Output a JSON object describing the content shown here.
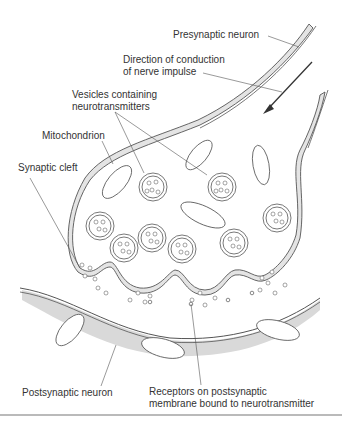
{
  "labels": {
    "presynaptic": "Presynaptic neuron",
    "direction_line1": "Direction of conduction",
    "direction_line2": "of nerve impulse",
    "vesicles_line1": "Vesicles containing",
    "vesicles_line2": "neurotransmitters",
    "mitochondrion": "Mitochondrion",
    "synaptic_cleft": "Synaptic cleft",
    "postsynaptic": "Postsynaptic neuron",
    "receptors_line1": "Receptors on postsynaptic",
    "receptors_line2": "membrane bound to neurotransmitter"
  },
  "colors": {
    "cytoplasm": "#e4e4e4",
    "postsynaptic_zone": "#d9d9d9",
    "outline": "#555555",
    "text": "#333333",
    "bottom_rule": "#777777"
  }
}
